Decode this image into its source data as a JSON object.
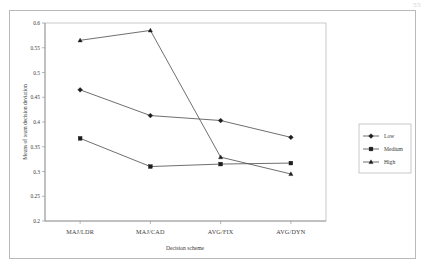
{
  "page": {
    "corner_note": "55"
  },
  "chart_data": {
    "type": "line",
    "title": "",
    "xlabel": "Decision scheme",
    "ylabel": "Means of team decision deviation",
    "categories": [
      "MAJ/LDR",
      "MAJ/CAD",
      "AVG/FIX",
      "AVG/DYN"
    ],
    "series": [
      {
        "name": "Low",
        "marker": "diamond",
        "values": [
          0.465,
          0.413,
          0.403,
          0.369
        ]
      },
      {
        "name": "Medium",
        "marker": "square",
        "values": [
          0.367,
          0.31,
          0.315,
          0.317
        ]
      },
      {
        "name": "High",
        "marker": "triangle",
        "values": [
          0.565,
          0.585,
          0.329,
          0.295
        ]
      }
    ],
    "ylim": [
      0.2,
      0.6
    ],
    "ytick_values": [
      0.2,
      0.25,
      0.3,
      0.35,
      0.4,
      0.45,
      0.5,
      0.55,
      0.6
    ],
    "ytick_labels": [
      "0.2",
      "0.25",
      "0.3",
      "0.35",
      "0.4",
      "0.45",
      "0.5",
      "0.55",
      "0.6"
    ],
    "grid": false,
    "legend_position": "right",
    "legend_entries": [
      "Low",
      "Medium",
      "High"
    ],
    "colors": {
      "line": "#4a4a4a",
      "marker": "#1d1d1d",
      "axis": "#8a8a8a",
      "text": "#3a3a3a",
      "background": "#ffffff"
    }
  }
}
